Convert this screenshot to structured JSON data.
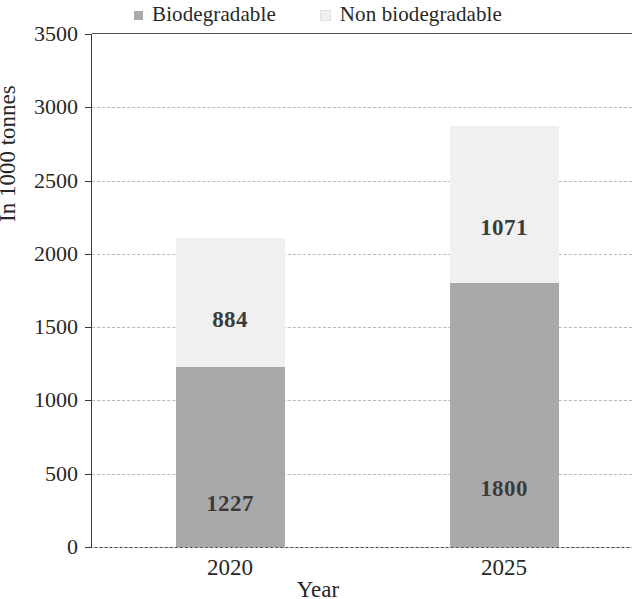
{
  "chart_data": {
    "type": "bar",
    "subtype": "stacked-bar",
    "title": "",
    "xlabel": "Year",
    "ylabel": "In 1000 tonnes",
    "categories": [
      "2020",
      "2025"
    ],
    "series": [
      {
        "name": "Biodegradable",
        "values": [
          1227,
          1800
        ],
        "color": "#a9a9a9"
      },
      {
        "name": "Non biodegradable",
        "values": [
          884,
          1071
        ],
        "color": "#f0f0f0"
      }
    ],
    "totals": [
      2111,
      2871
    ],
    "ylim": [
      0,
      3500
    ],
    "yticks": [
      0,
      500,
      1000,
      1500,
      2000,
      2500,
      3000,
      3500
    ],
    "ytick_labels": [
      "0",
      "500",
      "1000",
      "1500",
      "2000",
      "2500",
      "3000",
      "3500"
    ],
    "grid": true,
    "grid_style": "dashed",
    "legend_position": "top-center",
    "data_labels": [
      {
        "category": "2020",
        "series": "Biodegradable",
        "text": "1227"
      },
      {
        "category": "2020",
        "series": "Non biodegradable",
        "text": "884"
      },
      {
        "category": "2025",
        "series": "Biodegradable",
        "text": "1800"
      },
      {
        "category": "2025",
        "series": "Non biodegradable",
        "text": "1071"
      }
    ]
  },
  "legend": {
    "items": [
      {
        "label": "Biodegradable",
        "swatch": "#a9a9a9"
      },
      {
        "label": "Non biodegradable",
        "swatch": "#f0f0f0"
      }
    ]
  },
  "axes": {
    "y_title": "In 1000 tonnes",
    "x_title": "Year"
  }
}
